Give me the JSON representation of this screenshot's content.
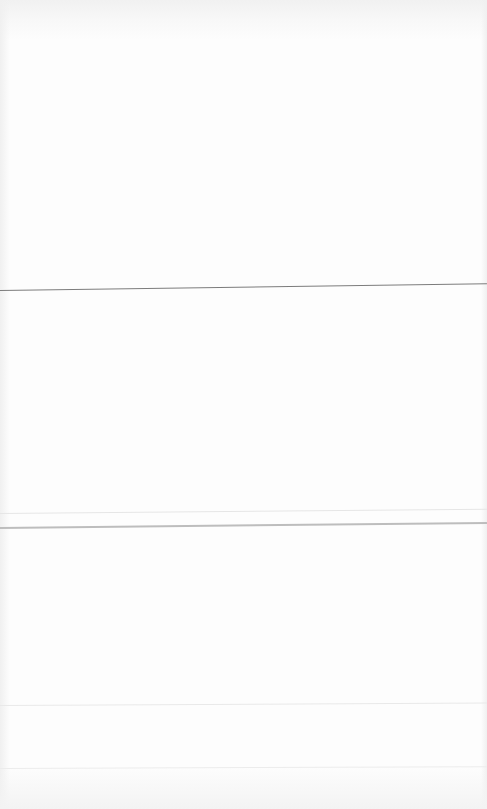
{
  "page": {
    "background_color": "#fdfdfd",
    "edge_shadow_color": "#f0f0f0"
  },
  "rules": [
    {
      "name": "divider-1",
      "color": "#7c7c7c"
    },
    {
      "name": "divider-2a",
      "color": "#e6e6e6"
    },
    {
      "name": "divider-2b",
      "color": "#bdbdbd"
    },
    {
      "name": "divider-3",
      "color": "#e9e9e9"
    },
    {
      "name": "divider-4",
      "color": "#ececec"
    }
  ],
  "sections": [
    {
      "name": "section-top",
      "text": ""
    },
    {
      "name": "section-middle",
      "text": ""
    },
    {
      "name": "section-lower",
      "text": ""
    },
    {
      "name": "section-footer",
      "text": ""
    }
  ]
}
